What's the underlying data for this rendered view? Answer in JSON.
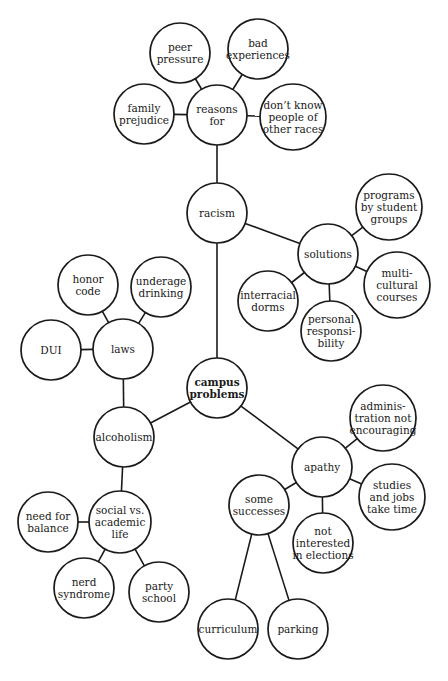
{
  "diagram": {
    "type": "cluster-map",
    "colors": {
      "stroke": "#1a1a1a",
      "fill": "#ffffff",
      "text": "#1a1a1a"
    },
    "nodes": [
      {
        "id": "campus-problems",
        "lines": [
          "campus",
          "problems"
        ],
        "cx": 217,
        "cy": 388,
        "r": 30,
        "bold": true
      },
      {
        "id": "racism",
        "lines": [
          "racism"
        ],
        "cx": 217,
        "cy": 213,
        "r": 30
      },
      {
        "id": "reasons-for",
        "lines": [
          "reasons",
          "for"
        ],
        "cx": 217,
        "cy": 115,
        "r": 30
      },
      {
        "id": "peer-pressure",
        "lines": [
          "peer",
          "pressure"
        ],
        "cx": 180,
        "cy": 53,
        "r": 30
      },
      {
        "id": "bad-experiences",
        "lines": [
          "bad",
          "experiences"
        ],
        "cx": 258,
        "cy": 49,
        "r": 30
      },
      {
        "id": "family-prejudice",
        "lines": [
          "family",
          "prejudice"
        ],
        "cx": 144,
        "cy": 114,
        "r": 30
      },
      {
        "id": "dont-know-people",
        "lines": [
          "don’t know",
          "people of",
          "other races"
        ],
        "cx": 293,
        "cy": 117,
        "r": 33
      },
      {
        "id": "solutions",
        "lines": [
          "solutions"
        ],
        "cx": 328,
        "cy": 254,
        "r": 30
      },
      {
        "id": "programs-by-student-groups",
        "lines": [
          "programs",
          "by student",
          "groups"
        ],
        "cx": 389,
        "cy": 207,
        "r": 33
      },
      {
        "id": "multicultural-courses",
        "lines": [
          "multi-",
          "cultural",
          "courses"
        ],
        "cx": 397,
        "cy": 285,
        "r": 33
      },
      {
        "id": "interracial-dorms",
        "lines": [
          "interracial",
          "dorms"
        ],
        "cx": 268,
        "cy": 301,
        "r": 30
      },
      {
        "id": "personal-responsibility",
        "lines": [
          "personal",
          "responsi-",
          "bility"
        ],
        "cx": 331,
        "cy": 331,
        "r": 30
      },
      {
        "id": "alcoholism",
        "lines": [
          "alcoholism"
        ],
        "cx": 124,
        "cy": 437,
        "r": 30
      },
      {
        "id": "laws",
        "lines": [
          "laws"
        ],
        "cx": 123,
        "cy": 349,
        "r": 30
      },
      {
        "id": "honor-code",
        "lines": [
          "honor",
          "code"
        ],
        "cx": 88,
        "cy": 285,
        "r": 30
      },
      {
        "id": "underage-drinking",
        "lines": [
          "underage",
          "drinking"
        ],
        "cx": 161,
        "cy": 287,
        "r": 30
      },
      {
        "id": "dui",
        "lines": [
          "DUI"
        ],
        "cx": 51,
        "cy": 350,
        "r": 30
      },
      {
        "id": "social-vs-academic-life",
        "lines": [
          "social vs.",
          "academic",
          "life"
        ],
        "cx": 120,
        "cy": 522,
        "r": 31
      },
      {
        "id": "need-for-balance",
        "lines": [
          "need for",
          "balance"
        ],
        "cx": 48,
        "cy": 522,
        "r": 30
      },
      {
        "id": "nerd-syndrome",
        "lines": [
          "nerd",
          "syndrome"
        ],
        "cx": 84,
        "cy": 588,
        "r": 30
      },
      {
        "id": "party-school",
        "lines": [
          "party",
          "school"
        ],
        "cx": 159,
        "cy": 592,
        "r": 30
      },
      {
        "id": "apathy",
        "lines": [
          "apathy"
        ],
        "cx": 322,
        "cy": 467,
        "r": 30
      },
      {
        "id": "administration-not-encouraging",
        "lines": [
          "adminis-",
          "tration not",
          "encouraging"
        ],
        "cx": 383,
        "cy": 418,
        "r": 33
      },
      {
        "id": "studies-and-jobs",
        "lines": [
          "studies",
          "and jobs",
          "take time"
        ],
        "cx": 392,
        "cy": 497,
        "r": 33
      },
      {
        "id": "some-successes",
        "lines": [
          "some",
          "successes"
        ],
        "cx": 259,
        "cy": 505,
        "r": 30
      },
      {
        "id": "not-interested-in-elections",
        "lines": [
          "not",
          "interested",
          "in elections"
        ],
        "cx": 323,
        "cy": 543,
        "r": 30
      },
      {
        "id": "curriculum",
        "lines": [
          "curriculum"
        ],
        "cx": 228,
        "cy": 629,
        "r": 30
      },
      {
        "id": "parking",
        "lines": [
          "parking"
        ],
        "cx": 298,
        "cy": 629,
        "r": 30
      }
    ],
    "edges": [
      [
        "campus-problems",
        "racism"
      ],
      [
        "racism",
        "reasons-for"
      ],
      [
        "reasons-for",
        "peer-pressure"
      ],
      [
        "reasons-for",
        "bad-experiences"
      ],
      [
        "reasons-for",
        "family-prejudice"
      ],
      [
        "reasons-for",
        "dont-know-people"
      ],
      [
        "racism",
        "solutions"
      ],
      [
        "solutions",
        "programs-by-student-groups"
      ],
      [
        "solutions",
        "multicultural-courses"
      ],
      [
        "solutions",
        "interracial-dorms"
      ],
      [
        "solutions",
        "personal-responsibility"
      ],
      [
        "campus-problems",
        "alcoholism"
      ],
      [
        "alcoholism",
        "laws"
      ],
      [
        "laws",
        "honor-code"
      ],
      [
        "laws",
        "underage-drinking"
      ],
      [
        "laws",
        "dui"
      ],
      [
        "alcoholism",
        "social-vs-academic-life"
      ],
      [
        "social-vs-academic-life",
        "need-for-balance"
      ],
      [
        "social-vs-academic-life",
        "nerd-syndrome"
      ],
      [
        "social-vs-academic-life",
        "party-school"
      ],
      [
        "campus-problems",
        "apathy"
      ],
      [
        "apathy",
        "administration-not-encouraging"
      ],
      [
        "apathy",
        "studies-and-jobs"
      ],
      [
        "apathy",
        "some-successes"
      ],
      [
        "apathy",
        "not-interested-in-elections"
      ],
      [
        "some-successes",
        "curriculum"
      ],
      [
        "some-successes",
        "parking"
      ]
    ]
  }
}
